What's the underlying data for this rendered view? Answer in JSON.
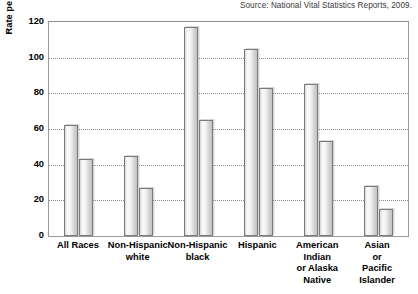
{
  "source_note": "Source: National Vital Statistics Reports, 2009.",
  "chart_data": {
    "type": "bar",
    "title": "",
    "xlabel": "",
    "ylabel": "Rate per 1,000 females in specified group",
    "ylim": [
      0,
      120
    ],
    "yticks": [
      0,
      20,
      40,
      60,
      80,
      100,
      120
    ],
    "ytick_labels": [
      "0",
      "20",
      "40",
      "60",
      "80",
      "100",
      "120"
    ],
    "grid": true,
    "legend": "none",
    "categories": [
      "All Races",
      "Non-Hispanic\nwhite",
      "Non-Hispanic\nblack",
      "Hispanic",
      "American\nIndian\nor Alaska\nNative",
      "Asian\nor\nPacific\nIslander"
    ],
    "series": [
      {
        "name": "Series 1",
        "values": [
          62,
          45,
          117,
          105,
          85,
          28
        ]
      },
      {
        "name": "Series 2",
        "values": [
          43,
          27,
          65,
          83,
          53,
          15
        ]
      }
    ]
  }
}
